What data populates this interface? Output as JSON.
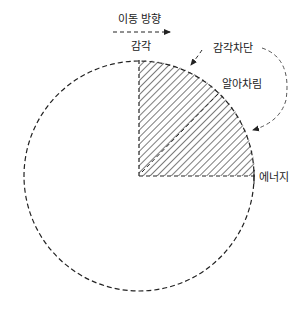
{
  "diagram": {
    "direction_label": "이동 방향",
    "labels": {
      "sensation": "감각",
      "sensation_block": "감각차단",
      "awareness": "알아차림",
      "energy": "에너지"
    },
    "colors": {
      "stroke": "#222222",
      "hatch": "#222222",
      "background": "#ffffff"
    }
  }
}
